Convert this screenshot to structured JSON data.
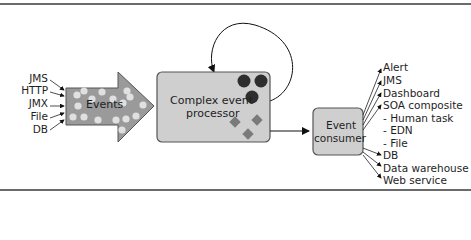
{
  "diagram": {
    "sources": [
      "JMS",
      "HTTP",
      "JMX",
      "File",
      "DB"
    ],
    "events_label": "Events",
    "processor_label_line1": "Complex event",
    "processor_label_line2": "processor",
    "consumer_label_line1": "Event",
    "consumer_label_line2": "consumer",
    "outputs": [
      "Alert",
      "JMS",
      "Dashboard",
      "SOA composite",
      "- Human task",
      "- EDN",
      "- File",
      "DB",
      "Data warehouse",
      "Web service"
    ],
    "colors": {
      "arrow_fill": "#9a9a9a",
      "box_fill": "#cfcfcf",
      "dot_light": "#e0e0e0",
      "circle_dark": "#2e2e2e",
      "diamond": "#7a7a7a",
      "rule": "#6b6b6b"
    }
  }
}
